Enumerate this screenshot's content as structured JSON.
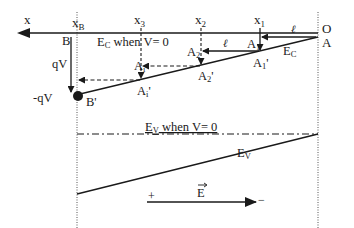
{
  "diagram": {
    "axis_label": "x",
    "origin_label_top": "O",
    "origin_label_bottom": "A",
    "positions": {
      "xB": {
        "main": "x",
        "sub": "B"
      },
      "x3": {
        "main": "x",
        "sub": "3"
      },
      "x2": {
        "main": "x",
        "sub": "2"
      },
      "x1": {
        "main": "x",
        "sub": "1"
      }
    },
    "points": {
      "B": "B",
      "B_prime": "B'",
      "Ai": {
        "main": "A",
        "sub": "i"
      },
      "Ai_prime": {
        "main": "A",
        "sub": "i",
        "prime": "'"
      },
      "A2": {
        "main": "A",
        "sub": "2"
      },
      "A2_prime": {
        "main": "A",
        "sub": "2",
        "prime": "'"
      },
      "A1": {
        "main": "A",
        "sub": "1"
      },
      "A1_prime": {
        "main": "A",
        "sub": "1",
        "prime": "'"
      }
    },
    "energy_labels": {
      "ec_when_v0": {
        "main": "E",
        "sub": "C",
        "rest": " when V= 0"
      },
      "ec": {
        "main": "E",
        "sub": "C"
      },
      "ev_when_v0": {
        "main": "E",
        "sub": "V",
        "rest": " when V= 0"
      },
      "ev": {
        "main": "E",
        "sub": "V"
      }
    },
    "voltage_labels": {
      "qv": "qV",
      "neg_qv": "-qV"
    },
    "ell_label": "ℓ",
    "field": {
      "label": "E",
      "plus": "+",
      "minus": "−"
    }
  }
}
